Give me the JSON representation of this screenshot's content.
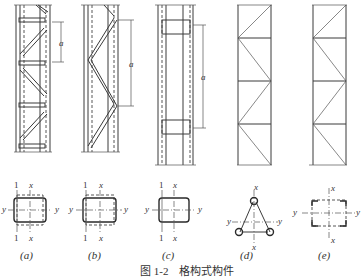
{
  "figure": {
    "caption": "图 1-2　格构式构件",
    "dimension_label": "a",
    "axis_labels": {
      "x": "x",
      "y": "y",
      "one": "1"
    },
    "subfigures": [
      {
        "id": "a",
        "label": "(a)",
        "description": "battened column with single-diagonal lacing and batten plates"
      },
      {
        "id": "b",
        "label": "(b)",
        "description": "laced column with zig-zag (V) lacing"
      },
      {
        "id": "c",
        "label": "(c)",
        "description": "batten-plate column"
      },
      {
        "id": "d",
        "label": "(d)",
        "description": "three-limb triangular lattice member"
      },
      {
        "id": "e",
        "label": "(e)",
        "description": "four-limb square lattice member"
      }
    ]
  }
}
